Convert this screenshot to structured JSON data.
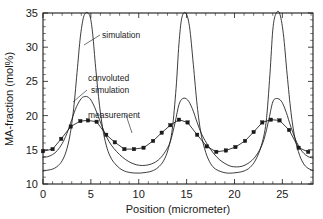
{
  "chart_data": {
    "type": "line",
    "title": "",
    "xlabel": "Position (micrometer)",
    "ylabel": "MA-fraction (mol%)",
    "xlim": [
      0,
      28.2
    ],
    "ylim": [
      10,
      35
    ],
    "xticks": [
      0,
      5,
      10,
      15,
      20,
      25
    ],
    "yticks": [
      10,
      15,
      20,
      25,
      30,
      35
    ],
    "xtick_labels": [
      "0",
      "5",
      "10",
      "15",
      "20",
      "25"
    ],
    "ytick_labels": [
      "10",
      "15",
      "20",
      "25",
      "30",
      "35"
    ],
    "x_minor_step": 1,
    "y_minor_step": 1,
    "grid": false,
    "legend": "inline-annotations",
    "peak_positions": [
      4.7,
      14.2,
      24.0
    ],
    "period": 9.65,
    "series": [
      {
        "name": "simulation",
        "style": "line",
        "baseline": 11.6,
        "peak": 35.0,
        "x": [
          0.0,
          0.4,
          0.8,
          1.2,
          1.6,
          2.0,
          2.4,
          2.8,
          3.2,
          3.6,
          3.9,
          4.2,
          4.45,
          4.7,
          4.95,
          5.2,
          5.5,
          5.9,
          6.3,
          6.7,
          7.1,
          7.5,
          8.0,
          8.5,
          9.0,
          9.6,
          10.2,
          10.8,
          11.4,
          12.0,
          12.6,
          13.1,
          13.5,
          13.9,
          14.2,
          14.5,
          14.9,
          15.3,
          15.7,
          16.1,
          16.5,
          17.0,
          17.5,
          18.0,
          18.6,
          19.2,
          19.8,
          20.4,
          21.0,
          21.6,
          22.2,
          22.8,
          23.3,
          23.7,
          24.0,
          24.3,
          24.7,
          25.1,
          25.5,
          25.9,
          26.3,
          26.8,
          27.3,
          27.8,
          28.2
        ],
        "y": [
          11.9,
          12.0,
          12.1,
          12.3,
          12.7,
          13.4,
          14.7,
          17.0,
          21.0,
          27.0,
          31.5,
          34.2,
          35.0,
          35.0,
          34.3,
          31.8,
          27.0,
          21.5,
          17.6,
          15.2,
          13.8,
          13.0,
          12.3,
          11.9,
          11.7,
          11.6,
          11.6,
          11.7,
          11.9,
          12.4,
          13.4,
          15.2,
          18.0,
          24.0,
          30.5,
          34.3,
          35.0,
          33.0,
          27.5,
          21.5,
          17.4,
          14.6,
          13.0,
          12.2,
          11.8,
          11.6,
          11.6,
          11.7,
          11.9,
          12.4,
          13.5,
          15.6,
          19.0,
          26.0,
          32.5,
          34.8,
          35.0,
          32.0,
          26.0,
          20.5,
          16.8,
          14.2,
          12.8,
          12.2,
          12.0
        ]
      },
      {
        "name": "convoluted simulation",
        "style": "line",
        "baseline": 12.6,
        "peak": 22.8,
        "x": [
          0.0,
          0.5,
          1.0,
          1.5,
          2.0,
          2.5,
          3.0,
          3.5,
          4.0,
          4.4,
          4.7,
          5.0,
          5.4,
          5.9,
          6.4,
          6.9,
          7.4,
          8.0,
          8.6,
          9.2,
          9.8,
          10.4,
          11.0,
          11.6,
          12.2,
          12.8,
          13.3,
          13.8,
          14.2,
          14.6,
          15.1,
          15.6,
          16.1,
          16.6,
          17.2,
          17.8,
          18.4,
          19.0,
          19.6,
          20.2,
          20.8,
          21.4,
          22.0,
          22.6,
          23.1,
          23.6,
          24.0,
          24.4,
          24.9,
          25.4,
          25.9,
          26.5,
          27.1,
          27.7,
          28.2
        ],
        "y": [
          13.9,
          14.0,
          14.3,
          14.9,
          15.9,
          17.4,
          19.4,
          21.3,
          22.5,
          22.8,
          22.7,
          22.3,
          21.2,
          19.4,
          17.6,
          16.2,
          15.2,
          14.3,
          13.6,
          13.1,
          12.8,
          12.7,
          12.8,
          13.1,
          13.7,
          14.8,
          16.2,
          19.0,
          21.6,
          22.5,
          22.3,
          21.0,
          19.0,
          17.2,
          15.7,
          14.5,
          13.6,
          13.0,
          12.6,
          12.5,
          12.6,
          13.0,
          13.7,
          14.9,
          16.6,
          19.5,
          22.0,
          22.5,
          22.1,
          20.5,
          18.3,
          16.1,
          14.7,
          14.0,
          13.8
        ]
      },
      {
        "name": "measurement",
        "style": "line-with-square-markers",
        "baseline": 14.7,
        "peak": 19.4,
        "x": [
          0.0,
          1.0,
          1.9,
          2.9,
          3.9,
          4.7,
          5.6,
          6.6,
          7.5,
          8.5,
          9.5,
          10.5,
          11.5,
          12.4,
          13.3,
          14.2,
          15.1,
          16.1,
          17.1,
          18.1,
          19.1,
          20.1,
          21.1,
          22.0,
          22.9,
          23.8,
          24.7,
          25.7,
          26.7,
          27.7
        ],
        "y": [
          14.8,
          15.1,
          16.6,
          18.4,
          19.2,
          19.3,
          19.1,
          17.2,
          16.1,
          15.1,
          15.1,
          15.3,
          16.3,
          17.5,
          18.6,
          19.4,
          19.0,
          17.2,
          15.5,
          14.7,
          14.9,
          15.4,
          16.3,
          17.6,
          19.0,
          19.4,
          19.3,
          17.9,
          15.3,
          14.7
        ]
      }
    ],
    "annotations": [
      {
        "name": "simulation",
        "text": "simulation",
        "x": 102,
        "y": 38
      },
      {
        "name": "convoluted-simulation-line1",
        "text": "convoluted",
        "x": 88,
        "y": 81
      },
      {
        "name": "convoluted-simulation-line2",
        "text": "simulation",
        "x": 91,
        "y": 93
      },
      {
        "name": "measurement",
        "text": "measurement",
        "x": 88,
        "y": 118
      }
    ]
  }
}
